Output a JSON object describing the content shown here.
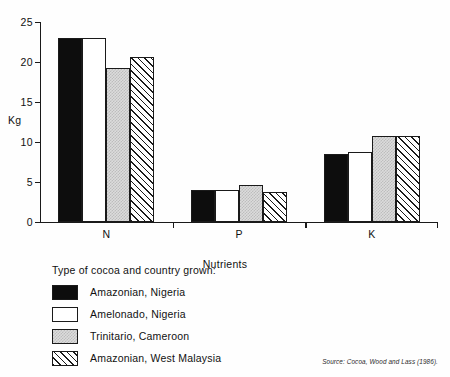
{
  "chart_data": {
    "type": "bar",
    "title": "",
    "xlabel": "Nutrients",
    "ylabel": "Kg",
    "ylim": [
      0,
      25
    ],
    "yticks": [
      0,
      5,
      10,
      15,
      20,
      25
    ],
    "grid": false,
    "legend_position": "below-left",
    "legend_title": "Type of cocoa and country grown:",
    "categories": [
      "N",
      "P",
      "K"
    ],
    "series": [
      {
        "name": "Amazonian, Nigeria",
        "pattern": "solid-black",
        "values": [
          23.0,
          4.0,
          8.5
        ]
      },
      {
        "name": "Amelonado, Nigeria",
        "pattern": "open-white",
        "values": [
          23.0,
          4.0,
          8.7
        ]
      },
      {
        "name": "Trinitario, Cameroon",
        "pattern": "gray-stipple",
        "values": [
          19.3,
          4.6,
          10.7
        ]
      },
      {
        "name": "Amazonian, West Malaysia",
        "pattern": "diagonal-hatch",
        "values": [
          20.6,
          3.7,
          10.7
        ]
      }
    ],
    "source": "Source: Cocoa, Wood and Lass (1986)."
  },
  "colors": {
    "axis": "#1a1a1a",
    "solid": "#0d0d0d",
    "open": "#ffffff",
    "stipple": "#dcdcdc",
    "hatch_line": "#1a1a1a",
    "background": "#fefefe"
  },
  "axis": {
    "y_title": "Kg",
    "x_title": "Nutrients",
    "tick_labels": [
      "0",
      "5",
      "10",
      "15",
      "20",
      "25"
    ]
  }
}
